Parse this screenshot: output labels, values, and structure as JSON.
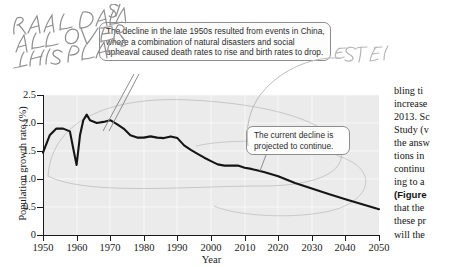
{
  "chart_data": {
    "type": "line",
    "title": "",
    "xlabel": "Year",
    "ylabel": "Population growth rate (%)",
    "xlim": [
      1950,
      2050
    ],
    "ylim": [
      0,
      2.5
    ],
    "xticks": [
      "1950",
      "1960",
      "1970",
      "1980",
      "1990",
      "2000",
      "2010",
      "2020",
      "2030",
      "2040",
      "2050"
    ],
    "yticks": [
      "0",
      "0.5",
      "1.0",
      "1.5",
      "2.0",
      "2.5"
    ],
    "grid": true,
    "legend_position": "none",
    "series": [
      {
        "name": "World population growth rate",
        "x": [
          1950,
          1952,
          1954,
          1956,
          1958,
          1959,
          1960,
          1961,
          1962,
          1963,
          1964,
          1966,
          1968,
          1970,
          1972,
          1974,
          1976,
          1978,
          1980,
          1982,
          1984,
          1986,
          1988,
          1990,
          1992,
          1994,
          1996,
          1998,
          2000,
          2002,
          2004,
          2006,
          2008,
          2010,
          2012,
          2014,
          2016,
          2020,
          2025,
          2030,
          2035,
          2040,
          2045,
          2050
        ],
        "values": [
          1.47,
          1.78,
          1.9,
          1.9,
          1.85,
          1.55,
          1.25,
          1.78,
          2.05,
          2.15,
          2.05,
          2.0,
          2.02,
          2.05,
          1.98,
          1.9,
          1.78,
          1.74,
          1.74,
          1.76,
          1.74,
          1.73,
          1.76,
          1.73,
          1.6,
          1.52,
          1.45,
          1.38,
          1.32,
          1.26,
          1.24,
          1.24,
          1.24,
          1.2,
          1.18,
          1.15,
          1.12,
          1.05,
          0.93,
          0.83,
          0.73,
          0.64,
          0.55,
          0.46
        ]
      }
    ]
  },
  "callouts": [
    {
      "id": "china-decline",
      "text": "The decline in the late 1950s resulted from events in China, where a combination of natural disasters and social upheaval caused death rates to rise and birth rates to drop."
    },
    {
      "id": "current-decline",
      "text": "The current decline is projected to continue."
    }
  ],
  "handwritten_annotations": [
    {
      "id": "real-data-note",
      "text": "REAL DATA IS ALL OVER THIS PLACE",
      "lines": [
        "REAL DATA IS",
        "ALL OVER",
        "THIS PLACE"
      ]
    },
    {
      "id": "estimate-note",
      "text": "ESTIMATE",
      "lines": [
        "ESTIMATE"
      ]
    }
  ],
  "text_column": {
    "lines": [
      "bling ti",
      "increase",
      "2013. Sc",
      "Study (v",
      "the answ",
      "tions in",
      "continu",
      "ing to a",
      "(Figure",
      "that the",
      "these pr",
      "will the"
    ],
    "bold_line_index": 8
  },
  "colors": {
    "plot_background": "#ebebeb",
    "gridline": "#f7f7f7",
    "data_line": "#151515",
    "axis": "#1a1a1a",
    "callout_border": "#8d8d8d",
    "callout_fill": "#fdfdfd",
    "pencil": "#9a9a9a"
  }
}
